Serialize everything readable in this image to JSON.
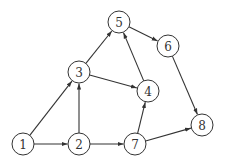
{
  "graph": {
    "type": "directed",
    "node_radius": 11,
    "stroke_color": "#333333",
    "fill_color": "#ffffff",
    "nodes": [
      {
        "id": "1",
        "label": "1",
        "x": 23,
        "y": 144
      },
      {
        "id": "2",
        "label": "2",
        "x": 79,
        "y": 144
      },
      {
        "id": "3",
        "label": "3",
        "x": 79,
        "y": 72
      },
      {
        "id": "4",
        "label": "4",
        "x": 148,
        "y": 91
      },
      {
        "id": "5",
        "label": "5",
        "x": 119,
        "y": 22
      },
      {
        "id": "6",
        "label": "6",
        "x": 168,
        "y": 46
      },
      {
        "id": "7",
        "label": "7",
        "x": 135,
        "y": 144
      },
      {
        "id": "8",
        "label": "8",
        "x": 202,
        "y": 125
      }
    ],
    "edges": [
      {
        "from": "1",
        "to": "2"
      },
      {
        "from": "1",
        "to": "3"
      },
      {
        "from": "2",
        "to": "3"
      },
      {
        "from": "2",
        "to": "7"
      },
      {
        "from": "3",
        "to": "5"
      },
      {
        "from": "3",
        "to": "4"
      },
      {
        "from": "4",
        "to": "5"
      },
      {
        "from": "5",
        "to": "6"
      },
      {
        "from": "6",
        "to": "8"
      },
      {
        "from": "7",
        "to": "4"
      },
      {
        "from": "7",
        "to": "8"
      }
    ]
  }
}
